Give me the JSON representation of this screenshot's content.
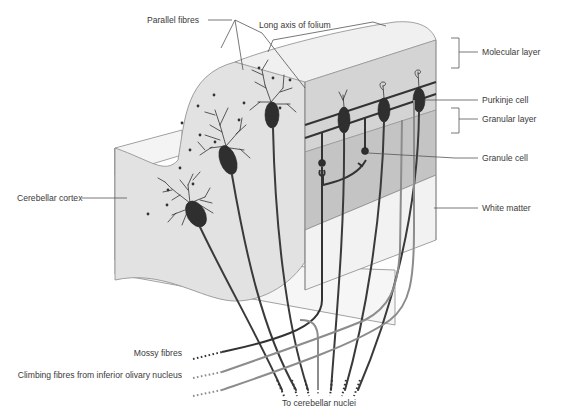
{
  "labels": {
    "long_axis": "Long axis of folium",
    "parallel_fibres": "Parallel fibres",
    "molecular_layer": "Molecular layer",
    "purkinje_cell": "Purkinje cell",
    "granular_layer": "Granular layer",
    "granule_cell": "Granule cell",
    "cerebellar_cortex": "Cerebellar cortex",
    "white_matter": "White matter",
    "mossy_fibres": "Mossy fibres",
    "climbing_fibres": "Climbing fibres from inferior olivary nucleus",
    "cerebellar_nuclei": "To cerebellar nuclei"
  },
  "colors": {
    "molecular_fill": "#d2d2d2",
    "granular_fill": "#c4c4c4",
    "cortex_front_fill": "#e2e2e2",
    "white_matter_fill": "#f2f2f2",
    "outline": "#8a8a8a",
    "neuron": "#2f2f2f",
    "climbing_fibre": "#8c8c8c"
  }
}
